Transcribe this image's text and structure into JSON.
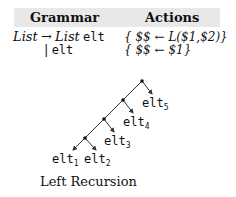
{
  "table": {
    "headers": {
      "grammar": "Grammar",
      "actions": "Actions"
    },
    "rows": [
      {
        "lhs": "List",
        "arrow": "→",
        "rhs_nt": "List",
        "rhs_t": "elt",
        "action": "{ $$ ← L($1,$2)}"
      },
      {
        "bar": "|",
        "rhs_t": "elt",
        "action": "{ $$ ← $1}"
      }
    ]
  },
  "tree": {
    "leaves": [
      {
        "base": "elt",
        "sub": "1"
      },
      {
        "base": "elt",
        "sub": "2"
      },
      {
        "base": "elt",
        "sub": "3"
      },
      {
        "base": "elt",
        "sub": "4"
      },
      {
        "base": "elt",
        "sub": "5"
      }
    ],
    "line_color": "#333333"
  },
  "caption": "Left Recursion"
}
